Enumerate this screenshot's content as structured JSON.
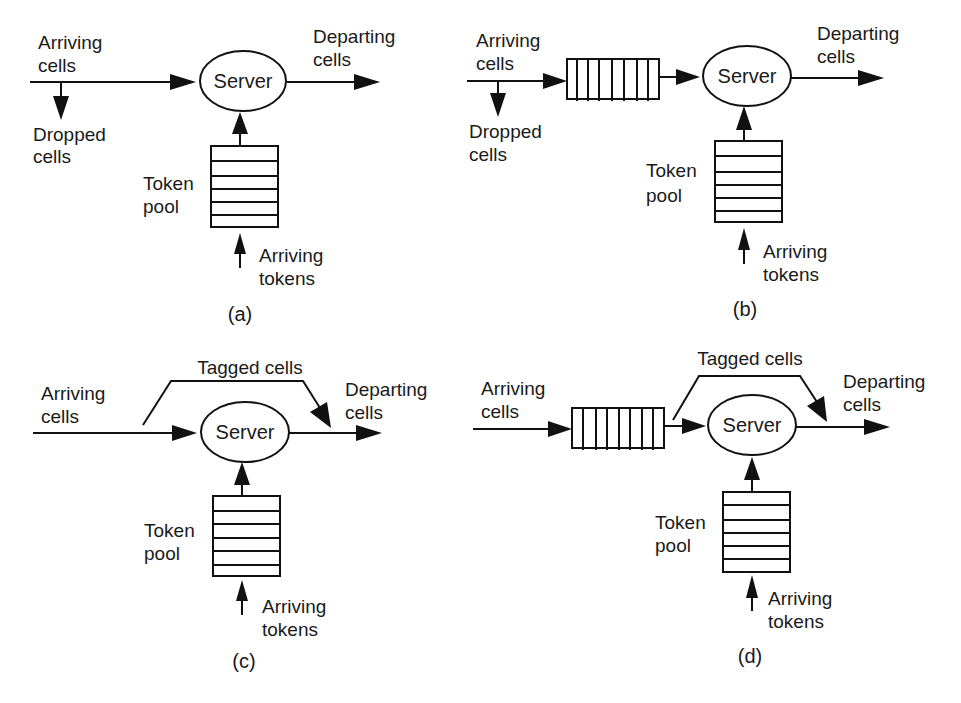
{
  "panels": {
    "a": {
      "caption": "(a)",
      "arriving_cells": [
        "Arriving",
        "cells"
      ],
      "dropped_cells": [
        "Dropped",
        "cells"
      ],
      "server": "Server",
      "departing_cells": [
        "Departing",
        "cells"
      ],
      "token_pool": [
        "Token",
        "pool"
      ],
      "arriving_tokens": [
        "Arriving",
        "tokens"
      ]
    },
    "b": {
      "caption": "(b)",
      "arriving_cells": [
        "Arriving",
        "cells"
      ],
      "dropped_cells": [
        "Dropped",
        "cells"
      ],
      "server": "Server",
      "departing_cells": [
        "Departing",
        "cells"
      ],
      "token_pool": [
        "Token",
        "pool"
      ],
      "arriving_tokens": [
        "Arriving",
        "tokens"
      ]
    },
    "c": {
      "caption": "(c)",
      "arriving_cells": [
        "Arriving",
        "cells"
      ],
      "tagged_cells": "Tagged cells",
      "server": "Server",
      "departing_cells": [
        "Departing",
        "cells"
      ],
      "token_pool": [
        "Token",
        "pool"
      ],
      "arriving_tokens": [
        "Arriving",
        "tokens"
      ]
    },
    "d": {
      "caption": "(d)",
      "arriving_cells": [
        "Arriving",
        "cells"
      ],
      "tagged_cells": "Tagged cells",
      "server": "Server",
      "departing_cells": [
        "Departing",
        "cells"
      ],
      "token_pool": [
        "Token",
        "pool"
      ],
      "arriving_tokens": [
        "Arriving",
        "tokens"
      ]
    }
  },
  "colors": {
    "stroke": "#111111",
    "text": "#1a1a1a",
    "background": "#ffffff"
  }
}
